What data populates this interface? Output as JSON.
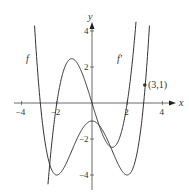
{
  "chart_data": {
    "type": "line",
    "title": "",
    "xlabel": "x",
    "ylabel": "y",
    "xlim": [
      -4.3,
      4.3
    ],
    "ylim": [
      -4.5,
      4.6
    ],
    "x_ticks": [
      "-4",
      "-2",
      "2",
      "4"
    ],
    "y_ticks": [
      "4",
      "2",
      "-2",
      "-4"
    ],
    "grid": false,
    "series": [
      {
        "name": "f",
        "formula": "(3/16)(x^2-4)^2 - 4",
        "key_points": [
          [
            -2,
            -4
          ],
          [
            0,
            -1
          ],
          [
            2,
            -4
          ],
          [
            3,
            1
          ]
        ]
      },
      {
        "name": "f'",
        "formula": "0.8 x (x^2-4)",
        "key_points": [
          [
            -2,
            0
          ],
          [
            -1.15,
            2.5
          ],
          [
            0,
            0
          ],
          [
            1.15,
            -2.5
          ],
          [
            2,
            0
          ]
        ]
      }
    ],
    "annotations": [
      {
        "label": "(3,1)",
        "x": 3,
        "y": 1
      }
    ],
    "curve_labels": {
      "f": "f",
      "fprime": "f′"
    }
  }
}
